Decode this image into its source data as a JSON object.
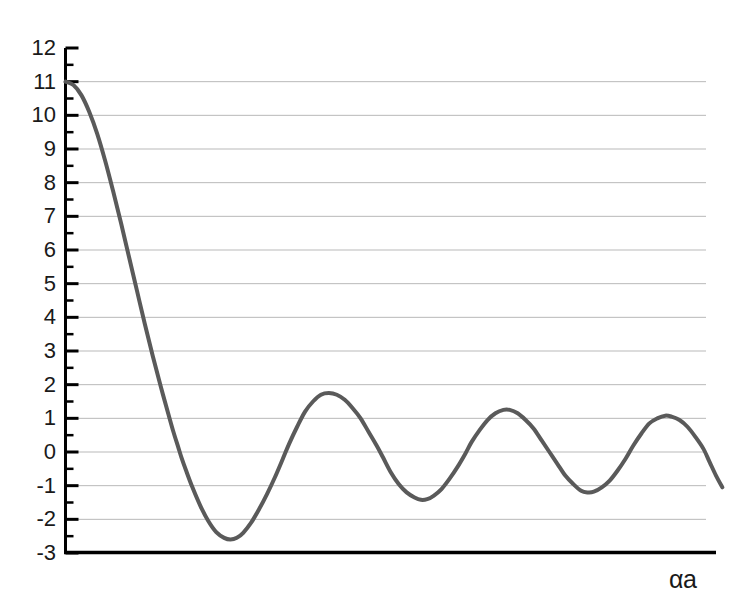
{
  "chart_data": {
    "type": "line",
    "title": "",
    "xlabel": "αa",
    "ylabel": "",
    "ylim": [
      -3,
      12
    ],
    "xlim": [
      0,
      20.5
    ],
    "grid": true,
    "legend": null,
    "y_ticks": [
      12,
      11,
      10,
      9,
      8,
      7,
      6,
      5,
      4,
      3,
      2,
      1,
      0,
      -1,
      -2,
      -3
    ],
    "y_tick_labels": [
      "12",
      "11",
      "10",
      "9",
      "8",
      "7",
      "6",
      "5",
      "4",
      "3",
      "2",
      "1",
      "0",
      "-1",
      "-2",
      "-3"
    ],
    "y_minor_tick_step": 0.5,
    "x_ticks": [],
    "x_tick_labels": [],
    "series": [
      {
        "name": "P sin(αa)/(αa) + cos(αa)",
        "color": "#5a5a5a",
        "line_width": 4,
        "points": [
          [
            0.0,
            11.0
          ],
          [
            0.25,
            10.9
          ],
          [
            0.5,
            10.6
          ],
          [
            0.75,
            10.1
          ],
          [
            1.0,
            9.45
          ],
          [
            1.25,
            8.65
          ],
          [
            1.5,
            7.75
          ],
          [
            1.75,
            6.8
          ],
          [
            2.0,
            5.8
          ],
          [
            2.25,
            4.8
          ],
          [
            2.5,
            3.8
          ],
          [
            2.75,
            2.85
          ],
          [
            3.0,
            1.95
          ],
          [
            3.25,
            1.1
          ],
          [
            3.4,
            0.6
          ],
          [
            3.55,
            0.15
          ],
          [
            3.65,
            -0.15
          ],
          [
            3.8,
            -0.55
          ],
          [
            4.0,
            -1.05
          ],
          [
            4.25,
            -1.6
          ],
          [
            4.5,
            -2.05
          ],
          [
            4.75,
            -2.38
          ],
          [
            5.0,
            -2.55
          ],
          [
            5.2,
            -2.6
          ],
          [
            5.4,
            -2.55
          ],
          [
            5.6,
            -2.4
          ],
          [
            5.85,
            -2.1
          ],
          [
            6.1,
            -1.7
          ],
          [
            6.35,
            -1.25
          ],
          [
            6.6,
            -0.75
          ],
          [
            6.85,
            -0.2
          ],
          [
            7.05,
            0.25
          ],
          [
            7.3,
            0.75
          ],
          [
            7.55,
            1.2
          ],
          [
            7.8,
            1.5
          ],
          [
            8.05,
            1.7
          ],
          [
            8.3,
            1.75
          ],
          [
            8.55,
            1.7
          ],
          [
            8.8,
            1.55
          ],
          [
            9.05,
            1.3
          ],
          [
            9.3,
            1.0
          ],
          [
            9.55,
            0.6
          ],
          [
            9.8,
            0.2
          ],
          [
            10.0,
            -0.15
          ],
          [
            10.25,
            -0.6
          ],
          [
            10.5,
            -0.95
          ],
          [
            10.75,
            -1.2
          ],
          [
            11.0,
            -1.35
          ],
          [
            11.2,
            -1.42
          ],
          [
            11.4,
            -1.4
          ],
          [
            11.6,
            -1.3
          ],
          [
            11.85,
            -1.1
          ],
          [
            12.1,
            -0.8
          ],
          [
            12.35,
            -0.45
          ],
          [
            12.6,
            -0.05
          ],
          [
            12.8,
            0.3
          ],
          [
            13.05,
            0.65
          ],
          [
            13.3,
            0.95
          ],
          [
            13.55,
            1.15
          ],
          [
            13.8,
            1.25
          ],
          [
            14.0,
            1.25
          ],
          [
            14.25,
            1.15
          ],
          [
            14.5,
            0.95
          ],
          [
            14.75,
            0.7
          ],
          [
            15.0,
            0.35
          ],
          [
            15.25,
            0.0
          ],
          [
            15.5,
            -0.35
          ],
          [
            15.75,
            -0.7
          ],
          [
            16.0,
            -0.95
          ],
          [
            16.25,
            -1.15
          ],
          [
            16.45,
            -1.2
          ],
          [
            16.65,
            -1.18
          ],
          [
            16.9,
            -1.05
          ],
          [
            17.15,
            -0.85
          ],
          [
            17.4,
            -0.55
          ],
          [
            17.65,
            -0.2
          ],
          [
            17.9,
            0.2
          ],
          [
            18.15,
            0.55
          ],
          [
            18.4,
            0.85
          ],
          [
            18.65,
            1.0
          ],
          [
            18.9,
            1.08
          ],
          [
            19.1,
            1.05
          ],
          [
            19.35,
            0.95
          ],
          [
            19.6,
            0.75
          ],
          [
            19.85,
            0.45
          ],
          [
            20.1,
            0.1
          ],
          [
            20.3,
            -0.3
          ],
          [
            20.5,
            -0.7
          ],
          [
            20.7,
            -1.05
          ]
        ],
        "peaks": [
          {
            "x": 0.0,
            "y": 11.0,
            "label": "start"
          },
          {
            "x": 8.3,
            "y": 1.75,
            "label": "peak-1"
          },
          {
            "x": 13.9,
            "y": 1.25,
            "label": "peak-2"
          },
          {
            "x": 18.95,
            "y": 1.08,
            "label": "peak-3"
          }
        ],
        "troughs": [
          {
            "x": 5.2,
            "y": -2.6,
            "label": "trough-1"
          },
          {
            "x": 11.2,
            "y": -1.42,
            "label": "trough-2"
          },
          {
            "x": 16.5,
            "y": -1.2,
            "label": "trough-3"
          }
        ]
      }
    ]
  },
  "axes": {
    "left_spine_color": "#000000",
    "bottom_spine_color": "#000000",
    "gridline_color": "#b9b9b9",
    "tick_color": "#000000"
  }
}
